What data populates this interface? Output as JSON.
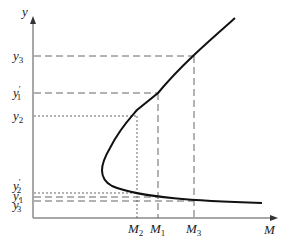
{
  "diagram": {
    "axes": {
      "x_label": "M",
      "y_label": "y",
      "axis_color": "#8a8a8a"
    },
    "curve_color": "#111111",
    "guide_color": "#666666",
    "y_levels": [
      {
        "id": "y3",
        "base": "y",
        "sub": "3",
        "prime": "",
        "style": "dashed"
      },
      {
        "id": "y1p",
        "base": "y",
        "sub": "1",
        "prime": "′",
        "style": "dashed"
      },
      {
        "id": "y2",
        "base": "y",
        "sub": "2",
        "prime": "",
        "style": "dotted"
      },
      {
        "id": "y2p",
        "base": "y",
        "sub": "2",
        "prime": "′",
        "style": "dotted"
      },
      {
        "id": "y1",
        "base": "y",
        "sub": "1",
        "prime": "",
        "style": "dashed"
      },
      {
        "id": "y3p",
        "base": "y",
        "sub": "3",
        "prime": "′",
        "style": "dashed"
      }
    ],
    "m_levels": [
      {
        "id": "M2",
        "base": "M",
        "sub": "2",
        "style": "dotted"
      },
      {
        "id": "M1",
        "base": "M",
        "sub": "1",
        "style": "dashed"
      },
      {
        "id": "M3",
        "base": "M",
        "sub": "3",
        "style": "dashed"
      }
    ]
  }
}
